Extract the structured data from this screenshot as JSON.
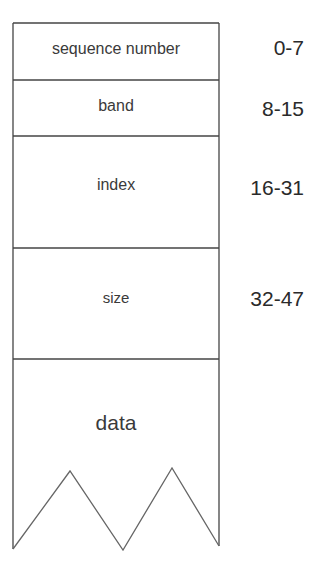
{
  "fields": [
    {
      "name": "sequence number",
      "bits": "0-7"
    },
    {
      "name": "band",
      "bits": "8-15"
    },
    {
      "name": "index",
      "bits": "16-31"
    },
    {
      "name": "size",
      "bits": "32-47"
    },
    {
      "name": "data",
      "bits": ""
    }
  ],
  "colors": {
    "stroke": "#444444",
    "background": "#ffffff"
  }
}
